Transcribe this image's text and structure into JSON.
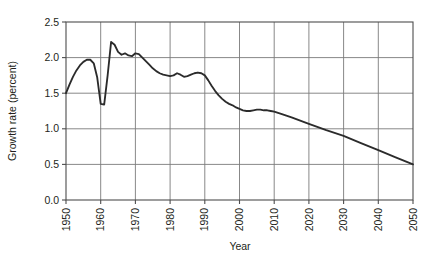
{
  "chart_data": {
    "type": "line",
    "title": "",
    "xlabel": "Year",
    "ylabel": "Growth rate (percent)",
    "xlim": [
      1950,
      2050
    ],
    "ylim": [
      0.0,
      2.5
    ],
    "grid": true,
    "legend": "none",
    "x_ticks": [
      1950,
      1960,
      1970,
      1980,
      1990,
      2000,
      2010,
      2020,
      2030,
      2040,
      2050
    ],
    "x_tick_labels": [
      "1950",
      "1960",
      "1970",
      "1980",
      "1990",
      "2000",
      "2010",
      "2020",
      "2030",
      "2040",
      "2050"
    ],
    "x_tick_label_rotation": -90,
    "y_ticks": [
      0.0,
      0.5,
      1.0,
      1.5,
      2.0,
      2.5
    ],
    "y_tick_labels": [
      "0.0",
      "0.5",
      "1.0",
      "1.5",
      "2.0",
      "2.5"
    ],
    "series": [
      {
        "name": "World population growth rate",
        "color": "#2b2b2b",
        "x": [
          1950,
          1951,
          1952,
          1953,
          1954,
          1955,
          1956,
          1957,
          1958,
          1959,
          1960,
          1961,
          1962,
          1963,
          1964,
          1965,
          1966,
          1967,
          1968,
          1969,
          1970,
          1971,
          1972,
          1973,
          1974,
          1975,
          1976,
          1977,
          1978,
          1979,
          1980,
          1981,
          1982,
          1983,
          1984,
          1985,
          1986,
          1987,
          1988,
          1989,
          1990,
          1991,
          1992,
          1993,
          1994,
          1995,
          1996,
          1997,
          1998,
          1999,
          2000,
          2001,
          2002,
          2003,
          2004,
          2005,
          2006,
          2007,
          2008,
          2009,
          2010,
          2012,
          2015,
          2020,
          2025,
          2030,
          2035,
          2040,
          2045,
          2050
        ],
        "y": [
          1.5,
          1.62,
          1.73,
          1.82,
          1.89,
          1.94,
          1.97,
          1.97,
          1.92,
          1.72,
          1.35,
          1.34,
          1.75,
          2.22,
          2.18,
          2.08,
          2.04,
          2.06,
          2.03,
          2.02,
          2.06,
          2.05,
          2.0,
          1.95,
          1.9,
          1.85,
          1.81,
          1.78,
          1.76,
          1.75,
          1.74,
          1.75,
          1.78,
          1.76,
          1.73,
          1.74,
          1.76,
          1.78,
          1.79,
          1.78,
          1.75,
          1.68,
          1.6,
          1.53,
          1.47,
          1.42,
          1.38,
          1.35,
          1.33,
          1.3,
          1.28,
          1.26,
          1.25,
          1.25,
          1.26,
          1.27,
          1.27,
          1.26,
          1.26,
          1.25,
          1.24,
          1.21,
          1.16,
          1.07,
          0.98,
          0.9,
          0.8,
          0.7,
          0.6,
          0.5
        ]
      }
    ]
  },
  "layout": {
    "plot_left": 66,
    "plot_right": 413,
    "plot_top": 22,
    "plot_bottom": 200
  }
}
